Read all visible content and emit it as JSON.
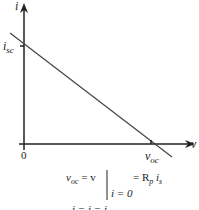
{
  "diagram": {
    "type": "i-v characteristic (Norton/Thevenin source line)",
    "axes": {
      "y_label": "i",
      "x_label": "v",
      "origin_label": "0"
    },
    "intercepts": {
      "y_intercept_label": "i",
      "y_intercept_sub": "sc",
      "x_intercept_label": "v",
      "x_intercept_sub": "oc"
    },
    "equations": {
      "line1_lhs": "v",
      "line1_lhs_sub": "oc",
      "line1_mid": " = v",
      "line1_rhs": "= R",
      "line1_rhs_sub": "p",
      "line1_rhs_tail": " i",
      "line1_rhs_tail_sub": "s",
      "line1_condition": "i = 0",
      "line2_partial": "i   = i         = i"
    },
    "colors": {
      "stroke": "#222222",
      "line": "#444444"
    }
  }
}
